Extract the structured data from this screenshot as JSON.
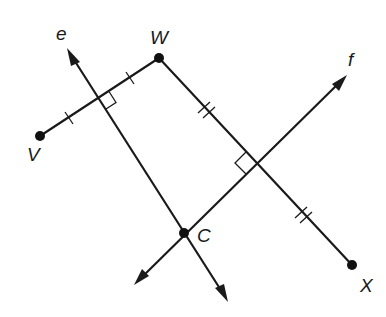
{
  "diagram": {
    "type": "geometry",
    "points": [
      {
        "name": "V",
        "x": 40,
        "y": 136,
        "label": "V",
        "label_x": 27,
        "label_y": 161
      },
      {
        "name": "W",
        "x": 159,
        "y": 58,
        "label": "W",
        "label_x": 150,
        "label_y": 44
      },
      {
        "name": "X",
        "x": 352,
        "y": 265,
        "label": "X",
        "label_x": 360,
        "label_y": 292
      },
      {
        "name": "C",
        "x": 184,
        "y": 233,
        "label": "C",
        "label_x": 197,
        "label_y": 242
      }
    ],
    "segments": [
      {
        "name": "VW",
        "from": "V",
        "to": "W",
        "tick_marks": 1
      },
      {
        "name": "WX",
        "from": "W",
        "to": "X",
        "tick_marks": 2
      }
    ],
    "lines": [
      {
        "name": "e",
        "label": "e",
        "label_x": 56,
        "label_y": 40,
        "through": [
          "C"
        ],
        "perpendicular_to": "VW",
        "bisects": "VW"
      },
      {
        "name": "f",
        "label": "f",
        "label_x": 348,
        "label_y": 66,
        "through": [
          "C"
        ],
        "perpendicular_to": "WX",
        "bisects": "WX"
      }
    ],
    "right_angle_markers": [
      {
        "at": "intersection of e and VW"
      },
      {
        "at": "intersection of f and WX"
      }
    ],
    "colors": {
      "stroke": "#1a1a1a",
      "background": "#ffffff"
    }
  }
}
